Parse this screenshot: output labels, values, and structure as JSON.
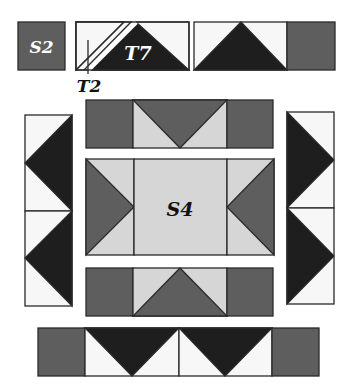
{
  "diagram": {
    "type": "quilt-block-assembly",
    "colors": {
      "dark": "#1e1e1e",
      "medium": "#5e5e5e",
      "light": "#d6d6d6",
      "white": "#f7f7f7",
      "outline": "#2a2a2a"
    },
    "labels": {
      "s2": "S2",
      "t7": "T7",
      "t2": "T2",
      "s4": "S4"
    },
    "pieces": [
      {
        "name": "S2",
        "desc": "dark square"
      },
      {
        "name": "T2",
        "desc": "white half-square triangle"
      },
      {
        "name": "T7",
        "desc": "dark flying-geese triangle"
      },
      {
        "name": "S4",
        "desc": "light center square"
      }
    ],
    "sections": [
      {
        "name": "key-row",
        "desc": "Legend row: S2 square, T2/T7 partial unit, full flying-geese unit with dark square"
      },
      {
        "name": "top-border-unit",
        "desc": "medium square, medium flying geese pointing down on light, medium square"
      },
      {
        "name": "left-column",
        "desc": "two white/dark flying geese units pointing left"
      },
      {
        "name": "center-unit",
        "desc": "medium triangles pointing right, light S4 square, medium triangles pointing left"
      },
      {
        "name": "right-column",
        "desc": "two white/dark flying geese units pointing right"
      },
      {
        "name": "bottom-border-unit",
        "desc": "medium square, medium flying geese pointing up on light, medium square"
      },
      {
        "name": "bottom-strip",
        "desc": "medium square, two dark flying geese pointing down on white, medium square"
      }
    ]
  }
}
